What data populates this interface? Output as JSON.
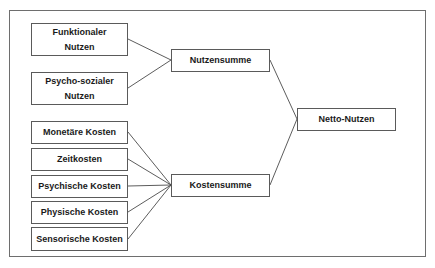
{
  "diagram": {
    "benefits": [
      {
        "label": "Funktionaler\nNutzen"
      },
      {
        "label": "Psycho-sozialer\nNutzen"
      }
    ],
    "costs": [
      {
        "label": "Monetäre Kosten"
      },
      {
        "label": "Zeitkosten"
      },
      {
        "label": "Psychische Kosten"
      },
      {
        "label": "Physische Kosten"
      },
      {
        "label": "Sensorische Kosten"
      }
    ],
    "benefit_sum": {
      "label": "Nutzensumme"
    },
    "cost_sum": {
      "label": "Kostensumme"
    },
    "result": {
      "label": "Netto-Nutzen"
    },
    "colors": {
      "line": "#4a4a4a",
      "border": "#5a5a5a",
      "text": "#1a1a1a"
    }
  }
}
